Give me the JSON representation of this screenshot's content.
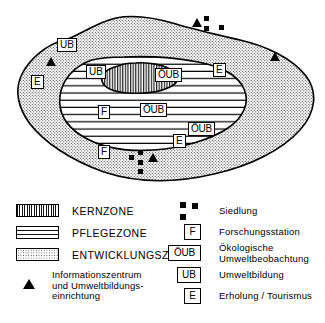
{
  "figure": {
    "type": "biosphere-reserve-zoning-map",
    "zones": [
      {
        "id": "kernzone",
        "label": "KERNZONE",
        "pattern": "vertical-stripes"
      },
      {
        "id": "pflegezone",
        "label": "PFLEGEZONE",
        "pattern": "horizontal-lines"
      },
      {
        "id": "entwicklungszone",
        "label": "ENTWICKLUNGSZONE",
        "pattern": "stipple-dots"
      }
    ],
    "map_labels": [
      {
        "id": "ub-outer-left",
        "text": "UB",
        "x": 57,
        "y": 38
      },
      {
        "id": "e-outer-left",
        "text": "E",
        "x": 31,
        "y": 75
      },
      {
        "id": "ub-inner-left",
        "text": "UB",
        "x": 86,
        "y": 65
      },
      {
        "id": "oub-core",
        "text": "ÖUB",
        "x": 155,
        "y": 68
      },
      {
        "id": "e-inner-right",
        "text": "E",
        "x": 213,
        "y": 63
      },
      {
        "id": "f-inner",
        "text": "F",
        "x": 98,
        "y": 105
      },
      {
        "id": "oub-mid",
        "text": "ÖUB",
        "x": 140,
        "y": 103
      },
      {
        "id": "oub-lower-right",
        "text": "ÖUB",
        "x": 188,
        "y": 122
      },
      {
        "id": "e-lower-right",
        "text": "E",
        "x": 173,
        "y": 134
      },
      {
        "id": "f-outer",
        "text": "F",
        "x": 98,
        "y": 145
      }
    ],
    "map_triangles": [
      {
        "id": "triangle-top",
        "x": 192,
        "y": 18
      },
      {
        "id": "triangle-left",
        "x": 46,
        "y": 57
      },
      {
        "id": "triangle-right",
        "x": 270,
        "y": 52
      },
      {
        "id": "triangle-bottom",
        "x": 148,
        "y": 153
      }
    ],
    "map_settlements": [
      {
        "id": "settlement-top",
        "squares": [
          [
            204,
            16
          ],
          [
            204,
            26
          ],
          [
            219,
            25
          ]
        ]
      },
      {
        "id": "settlement-bottom",
        "squares": [
          [
            138,
            150
          ],
          [
            138,
            160
          ],
          [
            129,
            155
          ],
          [
            138,
            169
          ]
        ]
      }
    ]
  },
  "legend": {
    "zone_entries": [
      {
        "id": "kernzone",
        "label": "KERNZONE",
        "swatch": "vertical-stripes"
      },
      {
        "id": "pflegezone",
        "label": "PFLEGEZONE",
        "swatch": "horizontal-lines"
      },
      {
        "id": "entwicklungszone",
        "label": "ENTWICKLUNGSZONE",
        "swatch": "stipple-dots"
      }
    ],
    "triangle_entry": {
      "id": "informationszentrum",
      "symbol": "triangle-icon",
      "line1": "Informationszentrum",
      "line2": "und Umweltbildungs-",
      "line3": "einrichtung"
    },
    "symbol_entries": [
      {
        "id": "siedlung",
        "symbol": "squares-cluster-icon",
        "label": "Siedlung"
      },
      {
        "id": "forschungsstation",
        "box": "F",
        "label": "Forschungsstation"
      },
      {
        "id": "oekologische-umweltbeobachtung",
        "box": "ÖUB",
        "label_line1": "Ökologische",
        "label_line2": "Umweltbeobachtung"
      },
      {
        "id": "umweltbildung",
        "box": "UB",
        "label": "Umweltbildung"
      },
      {
        "id": "erholung-tourismus",
        "box": "E",
        "label": "Erholung / Tourismus"
      }
    ]
  },
  "colors": {
    "ink": "#000000",
    "paper": "#ffffff",
    "stipple": "#555555"
  }
}
